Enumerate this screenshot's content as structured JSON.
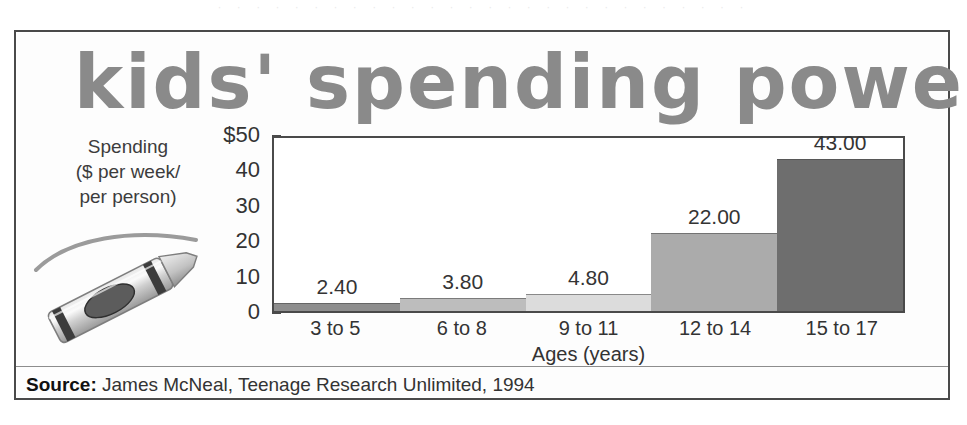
{
  "chart_data": {
    "type": "bar",
    "title": "kids' spending power",
    "categories": [
      "3 to 5",
      "6 to 8",
      "9 to 11",
      "12 to 14",
      "15 to 17"
    ],
    "values": [
      2.4,
      3.8,
      4.8,
      22.0,
      43.0
    ],
    "value_labels": [
      "2.40",
      "3.80",
      "4.80",
      "22.00",
      "43.00"
    ],
    "bar_colors": [
      "#8e8e8e",
      "#bdbdbd",
      "#dcdcdc",
      "#ababab",
      "#6e6e6e"
    ],
    "xlabel": "Ages (years)",
    "ylabel": "Spending ($ per week/ per person)",
    "ylim": [
      0,
      50
    ],
    "ytick_values": [
      50,
      40,
      30,
      20,
      10,
      0
    ],
    "ytick_labels": [
      "$50",
      "40",
      "30",
      "20",
      "10",
      "0"
    ],
    "grid": false,
    "legend": "none"
  },
  "y_caption": {
    "line1": "Spending",
    "line2": "($ per week/",
    "line3": "per person)"
  },
  "source": {
    "label": "Source:",
    "text": "James McNeal, Teenage Research Unlimited, 1994"
  },
  "decor": {
    "crayon_icon": "crayon-illustration",
    "scan_bleed": "· · · · · · · · · · · · · · · · · · · · · · · · · · · ·"
  }
}
